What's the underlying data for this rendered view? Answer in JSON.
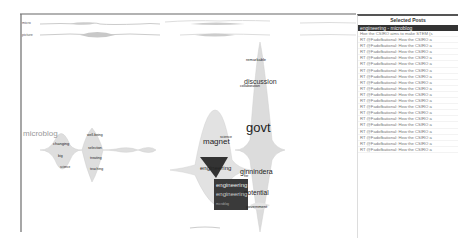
{
  "timeline": {
    "rows": [
      {
        "label": "micro"
      },
      {
        "label": "picture"
      }
    ]
  },
  "topics": {
    "microblog": {
      "title": "microblog",
      "words": [
        "changing",
        "big",
        "science",
        "well-being",
        "selection",
        "treating",
        "teaching",
        "sci"
      ]
    },
    "govt": {
      "title": "govt",
      "words": [
        "remarkable",
        "discussion",
        "collaboration",
        "govt",
        "ginnindera",
        "fter",
        "potential",
        "government"
      ]
    },
    "engineering": {
      "words": [
        "magnet",
        "science",
        "engineering",
        "engineering",
        "engineering",
        "microblog"
      ]
    }
  },
  "panel": {
    "title": "Selected Posts",
    "selected": "engineering - microblog",
    "rows": [
      "Hoe the CSIRO aims to make STEM (s",
      "RT @Fadofbational: How the CSIRO a",
      "RT @Fadofbational: How the CSIRO a",
      "RT @Fadofbational: How the CSIRO a",
      "RT @Fadofbational: How the CSIRO a",
      "RT @Fadofbational: How the CSIRO a",
      "RT @Fadofbational: How the CSIRO a",
      "RT @Fadofbational: How the CSIRO a",
      "RT @Fadofbational: How the CSIRO a",
      "RT @Fadofbational: How the CSIRO a",
      "RT @Fadofbational: How the CSIRO a",
      "RT @Fadofbational: How the CSIRO a",
      "RT @Fadofbational: How the CSIRO a",
      "RT @Fadofbational: How the CSIRO a",
      "RT @Fadofbational: How the CSIRO a",
      "RT @Fadofbational: How the CSIRO a",
      "RT @Fadofbational: How the CSIRO a",
      "RT @Fadofbational: How the CSIRO a",
      "RT @Fadofbational: How the CSIRO a",
      "RT @Fadofbational: How the CSIRO a"
    ]
  },
  "colors": {
    "stream": "#d9d9d9",
    "stream_dark": "#2e2e2e",
    "axis": "#666666"
  }
}
